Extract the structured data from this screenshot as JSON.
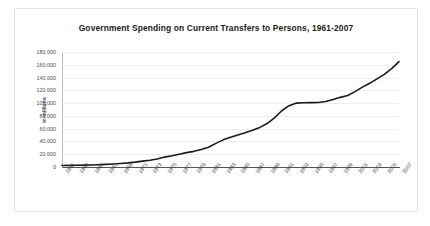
{
  "chart_data": {
    "type": "line",
    "title": "Government Spending on Current Transfers to Persons, 1961-2007",
    "xlabel": "",
    "ylabel": "in millions",
    "ylim": [
      0,
      180000
    ],
    "ytick_labels": [
      "180,000",
      "160,000",
      "140,000",
      "120,000",
      "100,000",
      "80,000",
      "60,000",
      "40,000",
      "20,000",
      "0"
    ],
    "ytick_values": [
      180000,
      160000,
      140000,
      120000,
      100000,
      80000,
      60000,
      40000,
      20000,
      0
    ],
    "xtick_labels": [
      "1961",
      "1963",
      "1965",
      "1967",
      "1969",
      "1971",
      "1973",
      "1975",
      "1977",
      "1979",
      "1981",
      "1983",
      "1985",
      "1987",
      "1989",
      "1991",
      "1993",
      "1995",
      "1997",
      "1999",
      "2001",
      "2003",
      "2005",
      "2007"
    ],
    "grid": true,
    "legend": false,
    "line_color": "#1a1a1a",
    "x": [
      1961,
      1962,
      1963,
      1964,
      1965,
      1966,
      1967,
      1968,
      1969,
      1970,
      1971,
      1972,
      1973,
      1974,
      1975,
      1976,
      1977,
      1978,
      1979,
      1980,
      1981,
      1982,
      1983,
      1984,
      1985,
      1986,
      1987,
      1988,
      1989,
      1990,
      1991,
      1992,
      1993,
      1994,
      1995,
      1996,
      1997,
      1998,
      1999,
      2000,
      2001,
      2002,
      2003,
      2004,
      2005,
      2006,
      2007
    ],
    "values": [
      2300,
      2500,
      2700,
      2900,
      3200,
      3600,
      4100,
      4800,
      5500,
      6400,
      7600,
      9200,
      10500,
      12500,
      15500,
      17500,
      20000,
      22500,
      24500,
      27500,
      31000,
      37000,
      42500,
      46500,
      50000,
      53500,
      57500,
      62000,
      68000,
      77000,
      88000,
      96000,
      100000,
      100500,
      100800,
      101000,
      102500,
      105500,
      109000,
      112000,
      118000,
      125000,
      131000,
      138000,
      145000,
      154000,
      165000
    ]
  }
}
